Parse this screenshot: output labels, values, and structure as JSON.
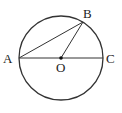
{
  "diagram": {
    "type": "circle-geometry",
    "stroke_color": "#333333",
    "circle": {
      "center": "O",
      "cx": 61,
      "cy": 58,
      "r": 42
    },
    "points": {
      "A": {
        "label": "A",
        "x": 19,
        "y": 58
      },
      "B": {
        "label": "B",
        "x": 83,
        "y": 22
      },
      "C": {
        "label": "C",
        "x": 103,
        "y": 58
      },
      "O": {
        "label": "O",
        "x": 61,
        "y": 58
      }
    },
    "segments": [
      {
        "from": "A",
        "to": "C",
        "name": "diameter-AC"
      },
      {
        "from": "A",
        "to": "B",
        "name": "chord-AB"
      },
      {
        "from": "O",
        "to": "B",
        "name": "radius-OB"
      }
    ]
  }
}
